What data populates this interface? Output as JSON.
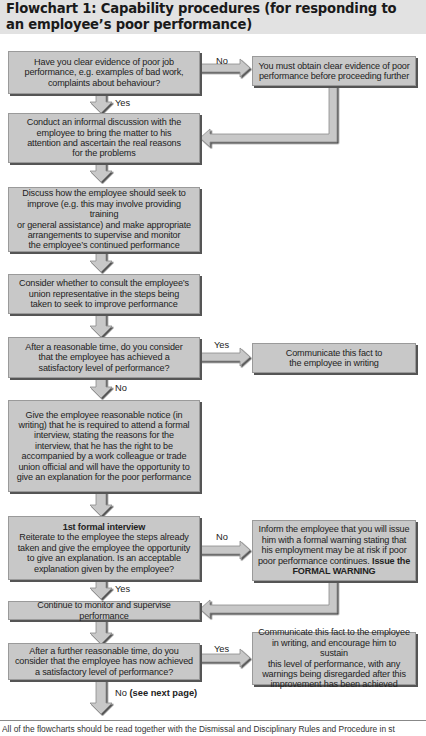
{
  "title": {
    "line1": "Flowchart 1: Capability procedures (for responding to",
    "line2": "an employee’s poor performance)"
  },
  "nodes": {
    "q1": {
      "lines": [
        "Have you clear evidence of poor job",
        "performance, e.g. examples of bad work,",
        "complaints about behaviour?"
      ]
    },
    "q1_no": {
      "lines": [
        "You must obtain clear evidence of poor",
        "performance before proceeding further"
      ]
    },
    "informal": {
      "lines": [
        "Conduct an informal discussion with the",
        "employee to bring the matter to his",
        "attention and ascertain the real reasons",
        "for the problems"
      ]
    },
    "improve": {
      "lines": [
        "Discuss how the employee should seek to",
        "improve (e.g. this may involve providing training",
        "or general assistance) and make appropriate",
        "arrangements to supervise and monitor",
        "the employee’s continued performance"
      ]
    },
    "union": {
      "lines": [
        "Consider whether to consult the employee’s",
        "union representative in the steps being",
        "taken to seek to improve performance"
      ]
    },
    "q2": {
      "lines": [
        "After a reasonable time, do you consider",
        "that the employee has achieved a",
        "satisfactory level of performance?"
      ]
    },
    "q2_yes": {
      "lines": [
        "Communicate this fact to",
        "the employee in writing"
      ]
    },
    "notice": {
      "lines": [
        "Give the employee reasonable notice (in",
        "writing) that he is required to attend a formal",
        "interview, stating the reasons for the",
        "interview, that he has the right to be",
        "accompanied by a work colleague or trade",
        "union official and will have the opportunity to",
        "give an explanation for the poor performance"
      ]
    },
    "interview": {
      "heading": "1st formal interview",
      "lines": [
        "Reiterate to the employee the steps already",
        "taken and give the employee the opportunity",
        "to give an explanation. Is an acceptable",
        "explanation given by the employee?"
      ]
    },
    "warning": {
      "lines": [
        "Inform the employee that you will issue",
        "him with a formal warning stating that",
        "his employment may be at risk if poor",
        "poor performance continues."
      ],
      "bold_tail": "Issue the",
      "bold_line": "FORMAL WARNING"
    },
    "monitor": {
      "lines": [
        "Continue to monitor and supervise performance"
      ]
    },
    "q3": {
      "lines": [
        "After a further reasonable time, do you",
        "consider that the employee has now achieved",
        "a satisfactory level of performance?"
      ]
    },
    "q3_yes": {
      "lines": [
        "Communicate this fact to the employee",
        "in writing, and encourage him to sustain",
        "this level of performance, with any",
        "warnings being disregarded after this",
        "improvement has been achieved"
      ]
    }
  },
  "labels": {
    "q1_no": "No",
    "q1_yes": "Yes",
    "q2_yes": "Yes",
    "q2_no": "No",
    "interview_no": "No",
    "interview_yes": "Yes",
    "q3_yes": "Yes",
    "q3_no": "No",
    "q3_no_suffix": "(see next page)"
  },
  "footer": {
    "text": "All of the flowcharts should be read together with the Dismissal and Disciplinary Rules and Procedure in st"
  },
  "colors": {
    "box_fill": "#c8c8c8",
    "box_shadow": "#555555",
    "arrow_fill": "#c8c8c8",
    "title_bg": "#e2e2e2"
  }
}
